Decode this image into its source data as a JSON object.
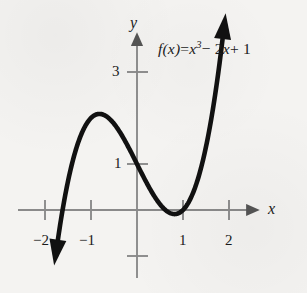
{
  "figure": {
    "kind": "cartesian-graph",
    "width": 307,
    "height": 293,
    "background_color": "#f4f3f1",
    "curve_color": "#111111",
    "axis_color": "#8a8a8a",
    "text_color": "#1a1a1a"
  },
  "labels": {
    "x_axis_name": "x",
    "y_axis_name": "y",
    "formula_fx": "f(x)",
    "formula_equals": "=",
    "formula_x": "x",
    "formula_exp": "3",
    "formula_minus": "− 2",
    "formula_x2": "x",
    "formula_plus": "+ 1",
    "formula_full": "f(x) = x³ − 2x + 1"
  },
  "chart_data": {
    "type": "line",
    "title": "",
    "subtitle": "",
    "xlabel": "x",
    "ylabel": "y",
    "legend": [
      "f(x) = x³ − 2x + 1"
    ],
    "legend_position": "top-right",
    "grid": false,
    "xlim": [
      -2.35,
      2.85
    ],
    "ylim": [
      -1.55,
      3.75
    ],
    "x_ticks": [
      -2,
      -1,
      1,
      2
    ],
    "x_tick_labels": [
      "−2",
      "−1",
      "1",
      "2"
    ],
    "y_ticks": [
      3,
      1,
      -1
    ],
    "y_tick_labels": [
      "3",
      "1",
      ""
    ],
    "annotations": [
      {
        "text": "f(x) = x³ − 2x + 1",
        "x": 1.1,
        "y": 3.45
      }
    ],
    "series": [
      {
        "name": "f(x) = x³ − 2x + 1",
        "equation": "x^3 - 2x + 1",
        "color": "#111111",
        "line_width": 4.6,
        "arrow_start": true,
        "arrow_end": true,
        "x_domain": [
          -1.72,
          1.86
        ],
        "x": [
          -1.72,
          -1.6,
          -1.5,
          -1.4,
          -1.3,
          -1.2,
          -1.1,
          -1.0,
          -0.9,
          -0.816,
          -0.7,
          -0.6,
          -0.5,
          -0.4,
          -0.3,
          -0.2,
          -0.1,
          0.0,
          0.1,
          0.2,
          0.3,
          0.4,
          0.5,
          0.6,
          0.7,
          0.816,
          0.9,
          1.0,
          1.1,
          1.2,
          1.3,
          1.4,
          1.5,
          1.6,
          1.7,
          1.8,
          1.86
        ],
        "y": [
          -0.65,
          -0.296,
          0.625,
          0.056,
          0.403,
          0.672,
          0.869,
          1.0,
          1.071,
          1.089,
          1.057,
          0.984,
          0.875,
          0.736,
          0.573,
          0.392,
          0.199,
          1.0,
          0.801,
          0.608,
          0.427,
          0.264,
          0.125,
          0.016,
          -0.057,
          -0.089,
          -0.071,
          0.0,
          0.131,
          0.328,
          0.597,
          0.944,
          1.375,
          1.896,
          2.513,
          3.232,
          3.695
        ]
      }
    ],
    "key_points": {
      "local_max": {
        "x": -0.816,
        "y": 2.089
      },
      "local_min": {
        "x": 0.816,
        "y": -0.089
      },
      "y_intercept": {
        "x": 0,
        "y": 1
      },
      "root_visible": {
        "x": 1,
        "y": 0
      }
    }
  }
}
